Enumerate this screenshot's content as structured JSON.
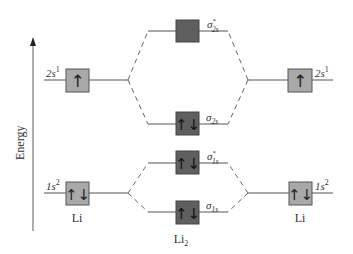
{
  "axis": {
    "label": "Energy",
    "direction": "up"
  },
  "colors": {
    "atomic_orbital_fill": "#a9a9a9",
    "molecular_orbital_fill": "#5f5f5f",
    "line": "#555555",
    "text": "#333333"
  },
  "left_atom": {
    "label": "Li",
    "orbitals": [
      {
        "name": "2s",
        "config": "2s",
        "superscript": "1",
        "electrons": "↑"
      },
      {
        "name": "1s",
        "config": "1s",
        "superscript": "2",
        "electrons": "↑↓"
      }
    ]
  },
  "right_atom": {
    "label": "Li",
    "orbitals": [
      {
        "name": "2s",
        "config": "2s",
        "superscript": "1",
        "electrons": "↑"
      },
      {
        "name": "1s",
        "config": "1s",
        "superscript": "2",
        "electrons": "↑↓"
      }
    ]
  },
  "molecule": {
    "label": "Li",
    "label_subscript": "2",
    "orbitals": [
      {
        "name": "sigma*2s",
        "symbol": "σ",
        "star": "*",
        "subscript": "2s",
        "electrons": ""
      },
      {
        "name": "sigma2s",
        "symbol": "σ",
        "star": "",
        "subscript": "2s",
        "electrons": "↑↓"
      },
      {
        "name": "sigma*1s",
        "symbol": "σ",
        "star": "*",
        "subscript": "1s",
        "electrons": "↑↓"
      },
      {
        "name": "sigma1s",
        "symbol": "σ",
        "star": "",
        "subscript": "1s",
        "electrons": "↑↓"
      }
    ]
  }
}
